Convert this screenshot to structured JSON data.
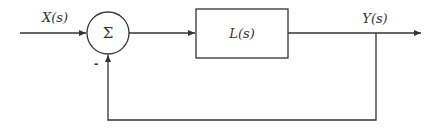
{
  "diagram": {
    "type": "feedback-control-block-diagram",
    "input_label": "X(s)",
    "output_label": "Y(s)",
    "summing_junction": {
      "symbol": "Σ",
      "feedback_sign": "-"
    },
    "block": {
      "label": "L(s)"
    },
    "colors": {
      "stroke": "#333333",
      "background": "#ffffff"
    }
  }
}
